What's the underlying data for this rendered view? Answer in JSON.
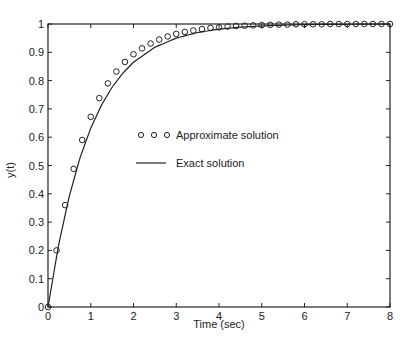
{
  "chart_data": {
    "type": "line",
    "title": "",
    "xlabel": "Time (sec)",
    "ylabel": "y(t)",
    "xlim": [
      0,
      8
    ],
    "ylim": [
      0,
      1
    ],
    "grid": false,
    "legend_position": "center",
    "xticks": [
      "0",
      "1",
      "2",
      "3",
      "4",
      "5",
      "6",
      "7",
      "8"
    ],
    "yticks": [
      "0",
      "0.1",
      "0.2",
      "0.3",
      "0.4",
      "0.5",
      "0.6",
      "0.7",
      "0.8",
      "0.9",
      "1"
    ],
    "series": [
      {
        "name": "Approximate solution",
        "style": "circle-markers",
        "x": [
          0,
          0.2,
          0.4,
          0.6,
          0.8,
          1.0,
          1.2,
          1.4,
          1.6,
          1.8,
          2.0,
          2.2,
          2.4,
          2.6,
          2.8,
          3.0,
          3.2,
          3.4,
          3.6,
          3.8,
          4.0,
          4.2,
          4.4,
          4.6,
          4.8,
          5.0,
          5.2,
          5.4,
          5.6,
          5.8,
          6.0,
          6.2,
          6.4,
          6.6,
          6.8,
          7.0,
          7.2,
          7.4,
          7.6,
          7.8,
          8.0
        ],
        "values": [
          0,
          0.2,
          0.36,
          0.488,
          0.59,
          0.672,
          0.738,
          0.79,
          0.832,
          0.866,
          0.893,
          0.914,
          0.931,
          0.945,
          0.956,
          0.965,
          0.972,
          0.977,
          0.982,
          0.986,
          0.988,
          0.991,
          0.993,
          0.994,
          0.995,
          0.996,
          0.997,
          0.998,
          0.998,
          0.999,
          0.999,
          0.999,
          0.999,
          1.0,
          1.0,
          1.0,
          1.0,
          1.0,
          1.0,
          1.0,
          1.0
        ]
      },
      {
        "name": "Exact solution",
        "style": "solid-line",
        "x": [
          0,
          0.25,
          0.5,
          0.75,
          1.0,
          1.25,
          1.5,
          1.75,
          2.0,
          2.5,
          3.0,
          3.5,
          4.0,
          4.5,
          5.0,
          5.5,
          6.0,
          7.0,
          8.0
        ],
        "values": [
          0,
          0.221,
          0.393,
          0.528,
          0.632,
          0.713,
          0.777,
          0.826,
          0.865,
          0.918,
          0.95,
          0.97,
          0.982,
          0.989,
          0.993,
          0.996,
          0.998,
          0.999,
          1.0
        ]
      }
    ]
  },
  "legend": {
    "approx_label": "Approximate solution",
    "exact_label": "Exact solution"
  },
  "axes": {
    "xlabel": "Time (sec)",
    "ylabel": "y(t)"
  }
}
